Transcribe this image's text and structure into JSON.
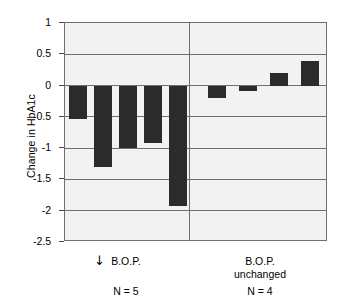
{
  "chart_data": {
    "type": "bar",
    "title": "",
    "xlabel": "",
    "ylabel": "Change in HbA1c",
    "ylim": [
      -2.5,
      1
    ],
    "yticks": [
      1,
      0.5,
      0,
      -0.5,
      -1,
      -1.5,
      -2,
      -2.5
    ],
    "ytick_labels": [
      "1",
      "0.5",
      "0",
      "-0.5",
      "-1",
      "-1.5",
      "-2",
      "-2.5"
    ],
    "grid": true,
    "legend": "none",
    "categories": [
      "1",
      "2",
      "3",
      "4",
      "5",
      "6",
      "7",
      "8",
      "9"
    ],
    "values": [
      -0.53,
      -1.3,
      -1.0,
      -0.92,
      -1.92,
      -0.2,
      -0.09,
      0.2,
      0.4
    ],
    "groups": [
      {
        "id": "bop-decreased",
        "caption": "B.O.P.",
        "caption_prefix_icon": "down-arrow",
        "n_label": "N = 5",
        "n": 5,
        "values": [
          -0.53,
          -1.3,
          -1.0,
          -0.92,
          -1.92
        ]
      },
      {
        "id": "bop-unchanged",
        "caption": "B.O.P.\nunchanged",
        "caption_prefix_icon": "",
        "n_label": "N = 4",
        "n": 4,
        "values": [
          -0.2,
          -0.09,
          0.2,
          0.4
        ]
      }
    ],
    "bar_color": "#2b2b2b",
    "plot_background": "#f2f2f2",
    "axis_color": "#6f6f6f"
  }
}
